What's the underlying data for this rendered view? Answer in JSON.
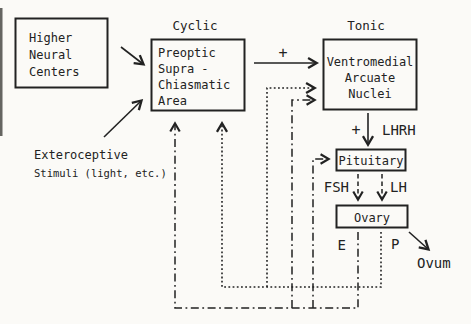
{
  "section_labels": {
    "cyclic": "Cyclic",
    "tonic": "Tonic"
  },
  "boxes": {
    "higher_neural_centers": {
      "lines": [
        "Higher",
        "Neural",
        "Centers"
      ]
    },
    "preoptic_suprachiasmatic_area": {
      "lines": [
        "Preoptic",
        "Supra -",
        "Chiasmatic",
        "Area"
      ]
    },
    "ventromedial_arcuate_nuclei": {
      "lines": [
        "Ventromedial",
        "Arcuate",
        "Nuclei"
      ]
    },
    "pituitary": {
      "label": "Pituitary"
    },
    "ovary": {
      "label": "Ovary"
    }
  },
  "external_input": {
    "lines": [
      "Exteroceptive",
      "Stimuli (light, etc.)"
    ]
  },
  "pathway_labels": {
    "plus_to_tonic": "+",
    "plus_lhrh": "+",
    "lhrh": "LHRH",
    "fsh": "FSH",
    "lh": "LH",
    "estrogen": "E",
    "progesterone": "P",
    "ovum": "Ovum"
  },
  "colors": {
    "background": "#fbfaf7",
    "ink": "#222222"
  }
}
